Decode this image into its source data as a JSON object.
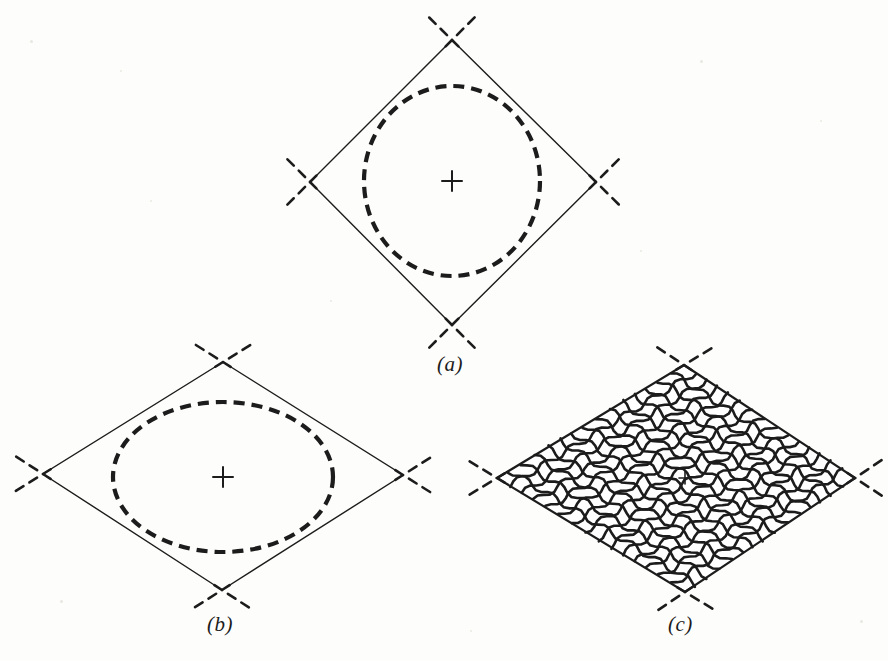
{
  "figure": {
    "background_color": "#fdfdfb",
    "ink_color": "#1c1c1c",
    "width": 888,
    "height": 661,
    "panel_count": 3
  },
  "labels": {
    "a": "(a)",
    "b": "(b)",
    "c": "(c)"
  },
  "panels": [
    {
      "id": "a",
      "label": "(a)",
      "description": "rhombus with inscribed dashed circle",
      "center": {
        "x": 452,
        "y": 181
      },
      "center_marker": "plus-cross",
      "rhombus": {
        "top": {
          "x": 452,
          "y": 40
        },
        "right": {
          "x": 596,
          "y": 182
        },
        "bottom": {
          "x": 452,
          "y": 325
        },
        "left": {
          "x": 310,
          "y": 182
        },
        "stroke_width": 1.4,
        "style": "solid"
      },
      "inscribed_curve": {
        "type": "circle",
        "cx": 452,
        "cy": 181,
        "rx": 88,
        "ry": 95,
        "style": "dashed",
        "stroke_width": 4.2,
        "dash": "11 7"
      },
      "vertex_extensions": {
        "style": "dashed",
        "stroke_width": 2.6,
        "dash": "9 7",
        "length": 34
      }
    },
    {
      "id": "b",
      "label": "(b)",
      "description": "wide rhombus with inscribed dashed ellipse",
      "center": {
        "x": 223,
        "y": 477
      },
      "center_marker": "plus-cross",
      "rhombus": {
        "top": {
          "x": 223,
          "y": 362
        },
        "right": {
          "x": 403,
          "y": 475
        },
        "bottom": {
          "x": 222,
          "y": 590
        },
        "left": {
          "x": 43,
          "y": 474
        },
        "stroke_width": 1.4,
        "style": "solid"
      },
      "inscribed_curve": {
        "type": "ellipse",
        "cx": 223,
        "cy": 477,
        "rx": 110,
        "ry": 75,
        "style": "dashed",
        "stroke_width": 4.2,
        "dash": "11 7"
      },
      "vertex_extensions": {
        "style": "dashed",
        "stroke_width": 2.6,
        "dash": "9 7",
        "length": 34
      }
    },
    {
      "id": "c",
      "label": "(c)",
      "description": "rhombus-shaped woven wire mesh / net",
      "center": {
        "x": 685,
        "y": 478
      },
      "center_marker": "plus-cross",
      "rhombus": {
        "top": {
          "x": 684,
          "y": 365
        },
        "right": {
          "x": 855,
          "y": 478
        },
        "bottom": {
          "x": 685,
          "y": 592
        },
        "left": {
          "x": 497,
          "y": 478
        },
        "stroke_width": 2.2,
        "style": "mesh-outline"
      },
      "mesh": {
        "lines_per_direction": 15,
        "cell_shape": "diamond",
        "stroke_width": 2.6,
        "waviness": 3.2,
        "style": "solid"
      },
      "vertex_extensions": {
        "style": "dashed",
        "stroke_width": 2.6,
        "dash": "9 7",
        "length": 34
      }
    }
  ],
  "chart_data": {
    "type": "diagram",
    "title": "",
    "annotations": [
      "(a)",
      "(b)",
      "(c)"
    ]
  }
}
